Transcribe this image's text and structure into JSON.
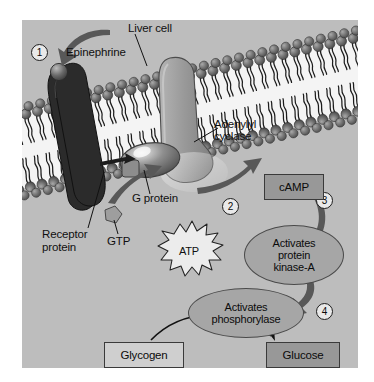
{
  "figure": {
    "background_color": "#bdbdbd",
    "panel_border_color": "#ffffff"
  },
  "labels": {
    "liver_cell": "Liver cell",
    "epinephrine": "Epinephrine",
    "receptor_protein_line1": "Receptor",
    "receptor_protein_line2": "protein",
    "gtp": "GTP",
    "g_protein": "G protein",
    "adenylyl_line1": "Adenylyl",
    "adenylyl_line2": "cyclase",
    "atp": "ATP"
  },
  "steps": [
    {
      "id": "1",
      "label": "1"
    },
    {
      "id": "2",
      "label": "2"
    },
    {
      "id": "3",
      "label": "3"
    },
    {
      "id": "4",
      "label": "4"
    }
  ],
  "nodes": {
    "camp": {
      "text": "cAMP",
      "style": "dark"
    },
    "kinase": {
      "line1": "Activates",
      "line2": "protein",
      "line3": "kinase-A"
    },
    "phosphorylase": {
      "line1": "Activates",
      "line2": "phosphorylase"
    },
    "glycogen": {
      "text": "Glycogen",
      "style": "light"
    },
    "glucose": {
      "text": "Glucose",
      "style": "dark"
    }
  },
  "colors": {
    "receptor_protein": "#2b2b2b",
    "adenylyl_cyclase": "#9a9a9a",
    "g_protein": "#6e6e6e",
    "membrane_head": "#6d6d6d",
    "membrane_interior": "#f2f2f2",
    "arrow": "#585858",
    "ellipse_fill": "#a6a6a6",
    "box_dark": "#989898",
    "box_light": "#cfcfcf"
  }
}
